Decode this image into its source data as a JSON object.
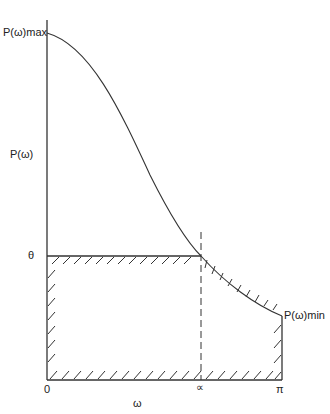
{
  "labels": {
    "pmax": "P(ω)max",
    "pomega": "P(ω)",
    "theta": "θ",
    "pmin": "P(ω)min",
    "zero": "0",
    "alpha": "∝",
    "pi": "π",
    "omega": "ω"
  },
  "geometry": {
    "axis_x": 47,
    "axis_top": 20,
    "axis_bottom": 380,
    "curve_start_y": 33,
    "theta_y": 256,
    "alpha_x": 201,
    "pi_x": 282,
    "pmin_y": 316
  },
  "colors": {
    "line": "#333333",
    "background": "#ffffff"
  }
}
